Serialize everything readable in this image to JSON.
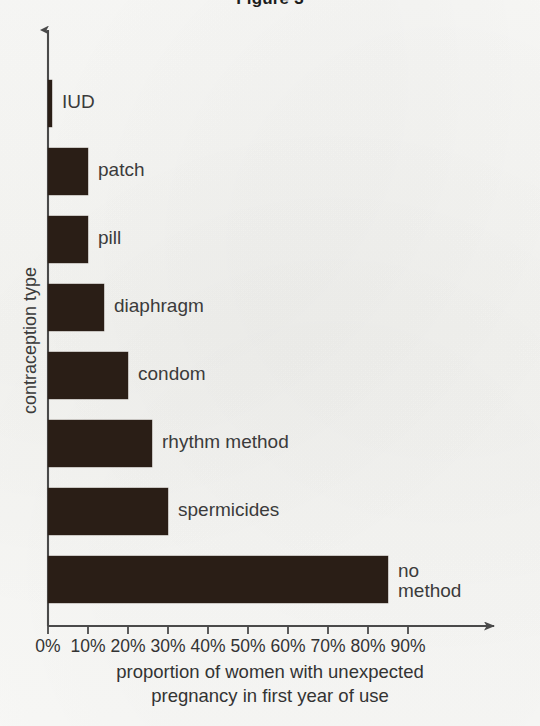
{
  "figure": {
    "title": "Figure 3"
  },
  "chart_data": {
    "type": "bar",
    "orientation": "horizontal",
    "title": "Figure 3",
    "xlabel": "proportion of women with unexpected\npregnancy in first year of use",
    "ylabel": "contraception type",
    "xlim": [
      0,
      95
    ],
    "xticks": [
      0,
      10,
      20,
      30,
      40,
      50,
      60,
      70,
      80,
      90
    ],
    "xtick_labels": [
      "0%",
      "10%",
      "20%",
      "30%",
      "40%",
      "50%",
      "60%",
      "70%",
      "80%",
      "90%"
    ],
    "grid": false,
    "legend": "none",
    "bar_color": "#2a1e16",
    "categories": [
      "IUD",
      "patch",
      "pill",
      "diaphragm",
      "condom",
      "rhythm method",
      "spermicides",
      "no method"
    ],
    "values": [
      1,
      10,
      10,
      14,
      20,
      26,
      30,
      85
    ],
    "units": "percent"
  },
  "bars": [
    {
      "label": "IUD",
      "value": 1,
      "label_text": "IUD"
    },
    {
      "label": "patch",
      "value": 10,
      "label_text": "patch"
    },
    {
      "label": "pill",
      "value": 10,
      "label_text": "pill"
    },
    {
      "label": "diaphragm",
      "value": 14,
      "label_text": "diaphragm"
    },
    {
      "label": "condom",
      "value": 20,
      "label_text": "condom"
    },
    {
      "label": "rhythm method",
      "value": 26,
      "label_text": "rhythm method"
    },
    {
      "label": "spermicides",
      "value": 30,
      "label_text": "spermicides"
    },
    {
      "label": "no method",
      "value": 85,
      "label_text": "no\nmethod"
    }
  ],
  "axes": {
    "x_tick_labels": [
      "0%",
      "10%",
      "20%",
      "30%",
      "40%",
      "50%",
      "60%",
      "70%",
      "80%",
      "90%"
    ],
    "y_axis_title": "contraception type",
    "x_axis_title": "proportion of women with unexpected\npregnancy in first year of use"
  },
  "colors": {
    "bar": "#2a1e16",
    "axis": "#4a4a4a",
    "text": "#3b3b3b",
    "background": "#f7f7f5"
  }
}
